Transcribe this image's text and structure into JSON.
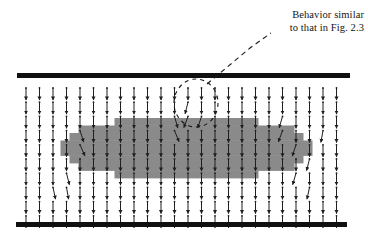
{
  "figure": {
    "background_color": "#ffffff"
  },
  "annotation": {
    "name": "behavior-callout",
    "line1": "Behavior similar",
    "line2": "to that in Fig. 2.3",
    "text_color": "#141414",
    "leader_style": "dashed",
    "leader_color": "#1a1a1a",
    "highlight_shape": "ellipse",
    "highlight_style": "dashed"
  },
  "plates": {
    "color": "#101010",
    "top": {
      "label": "top-plate",
      "x1": 17,
      "y": 73,
      "x2": 350,
      "thickness": 5
    },
    "bottom": {
      "label": "bottom-plate",
      "x1": 16,
      "y": 222,
      "x2": 347,
      "thickness": 5
    }
  },
  "region": {
    "label": "gray-region",
    "fill_color": "#8a8a8a",
    "shape": "lens",
    "x_min": 62,
    "x_max": 311,
    "y_min": 118,
    "y_max": 178
  },
  "chart_data": {
    "type": "scatter",
    "xlabel": "",
    "ylabel": "",
    "xlim": [
      17,
      350
    ],
    "ylim": [
      73,
      222
    ],
    "grid": false,
    "legend": null,
    "vector_field": {
      "columns": 24,
      "rows": 10,
      "x_start": 26,
      "x_step": 13.5,
      "y_start": 88,
      "y_step": 14.2,
      "default_angle_deg": 0,
      "arrow_color": "#1f1f1f",
      "arrow_length": 12,
      "deflections": [
        {
          "col": 4,
          "row": 3,
          "angle_deg": 18
        },
        {
          "col": 4,
          "row": 4,
          "angle_deg": 24
        },
        {
          "col": 3,
          "row": 6,
          "angle_deg": 14
        },
        {
          "col": 3,
          "row": 7,
          "angle_deg": 10
        },
        {
          "col": 12,
          "row": 1,
          "angle_deg": -14
        },
        {
          "col": 12,
          "row": 2,
          "angle_deg": -20
        },
        {
          "col": 11,
          "row": 2,
          "angle_deg": 16
        },
        {
          "col": 11,
          "row": 3,
          "angle_deg": 22
        },
        {
          "col": 13,
          "row": 2,
          "angle_deg": -18
        },
        {
          "col": 19,
          "row": 2,
          "angle_deg": -16
        },
        {
          "col": 19,
          "row": 3,
          "angle_deg": -20
        },
        {
          "col": 20,
          "row": 4,
          "angle_deg": -18
        },
        {
          "col": 21,
          "row": 5,
          "angle_deg": -14
        },
        {
          "col": 20,
          "row": 6,
          "angle_deg": -16
        },
        {
          "col": 21,
          "row": 7,
          "angle_deg": -12
        },
        {
          "col": 22,
          "row": 3,
          "angle_deg": -10
        },
        {
          "col": 2,
          "row": 7,
          "angle_deg": 12
        }
      ]
    }
  }
}
